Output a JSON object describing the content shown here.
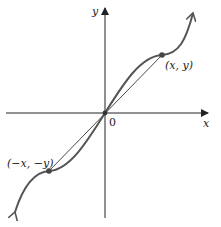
{
  "diagram": {
    "type": "odd-function-graph",
    "axes": {
      "x_label": "x",
      "y_label": "y",
      "origin_label": "0"
    },
    "points": [
      {
        "label": "(x, y)"
      },
      {
        "label": "(−x, −y)"
      }
    ],
    "colors": {
      "curve": "#555555",
      "axes": "#222222",
      "points": "#444444"
    }
  }
}
